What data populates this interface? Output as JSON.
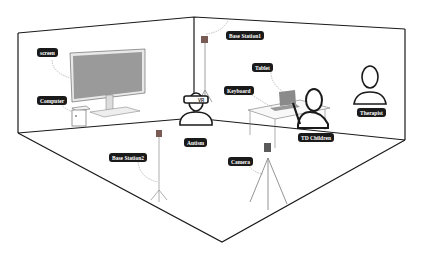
{
  "diagram": {
    "labels": {
      "screen": "screen",
      "computer": "Computer",
      "base_station1": "Base Station1",
      "tablet": "Tablet",
      "keyboard": "Keyboard",
      "therapist": "Therapist",
      "autism": "Autism",
      "td_children": "TD Children",
      "base_station2": "Base Station2",
      "camera": "Camera",
      "vr": "VR"
    },
    "colors": {
      "outline": "#1a1a1a",
      "screen_fill": "#9a9a9a",
      "station_fill": "#7a5a55",
      "label_bg": "#1a1a1a",
      "label_text": "#ffffff"
    }
  }
}
